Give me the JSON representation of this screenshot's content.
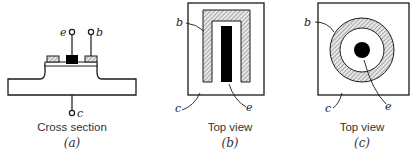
{
  "figure": {
    "panels": [
      {
        "id": "a",
        "caption": "Cross section",
        "sublabel": "(a)",
        "terminals": {
          "emitter": "e",
          "base": "b",
          "collector": "c"
        }
      },
      {
        "id": "b",
        "caption": "Top view",
        "sublabel": "(b)",
        "labels": {
          "base": "b",
          "collector": "c",
          "emitter": "e"
        }
      },
      {
        "id": "c",
        "caption": "Top view",
        "sublabel": "(c)",
        "labels": {
          "base": "b",
          "collector": "c",
          "emitter": "e"
        }
      }
    ],
    "colors": {
      "stroke": "#1a1a1a",
      "emitter_fill": "#000000",
      "hatch": "#777777",
      "background": "#ffffff"
    }
  }
}
